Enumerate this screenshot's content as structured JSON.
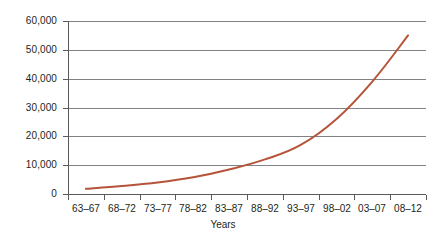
{
  "chart_data": {
    "type": "line",
    "title": "",
    "subtitle": "",
    "xlabel": "Years",
    "ylabel": "",
    "categories": [
      "63–67",
      "68–72",
      "73–77",
      "78–82",
      "83–87",
      "88–92",
      "93–97",
      "98–02",
      "03–07",
      "08–12"
    ],
    "series": [
      {
        "name": "",
        "values": [
          1800,
          2800,
          4000,
          5800,
          8500,
          12000,
          17000,
          26000,
          39000,
          55000
        ],
        "color": "#b5543a"
      }
    ],
    "ylim": [
      0,
      60000
    ],
    "ytick_values": [
      0,
      10000,
      20000,
      30000,
      40000,
      50000,
      60000
    ],
    "ytick_labels": [
      "0",
      "10,000",
      "20,000",
      "30,000",
      "40,000",
      "50,000",
      "60,000"
    ],
    "grid": true,
    "grid_axis": "y",
    "legend": false,
    "legend_position": "none",
    "markers": false,
    "line_width": 2,
    "colors": {
      "series": "#b5543a",
      "gridline": "#808285",
      "axis": "#58595b",
      "text": "#231f20",
      "background": "#ffffff"
    }
  }
}
